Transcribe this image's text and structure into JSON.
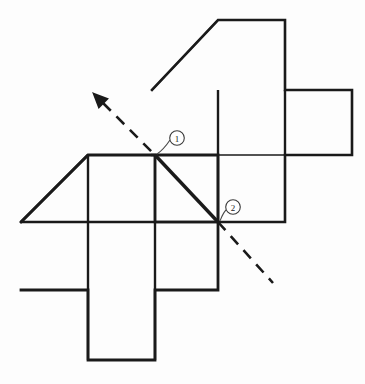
{
  "figure": {
    "type": "geometry-net-diagram",
    "background_color": "#fdfdfd",
    "stroke_color": "#1a1a1a",
    "grid_unit_px": 67,
    "thin_stroke_width": 1.2,
    "thick_stroke_width": 2.6,
    "diagonal_stroke_width": 3.2,
    "dash_pattern": "11 8"
  },
  "labels": [
    {
      "id": "callout-1",
      "text": "1",
      "circle_center": {
        "x": 177,
        "y": 138
      },
      "circle_radius": 7.5,
      "leader_from": {
        "x": 157,
        "y": 153
      },
      "leader_to": {
        "x": 170,
        "y": 139
      }
    },
    {
      "id": "callout-2",
      "text": "2",
      "circle_center": {
        "x": 233,
        "y": 207
      },
      "circle_radius": 7.5,
      "leader_from": {
        "x": 220,
        "y": 220
      },
      "leader_to": {
        "x": 226,
        "y": 209
      }
    }
  ],
  "marked_points": [
    {
      "name": "point-1",
      "x": 155,
      "y": 155
    },
    {
      "name": "point-2",
      "x": 218,
      "y": 222
    }
  ],
  "axis_line": {
    "name": "dashed-axis-of-rotation",
    "start": {
      "x": 96,
      "y": 96
    },
    "end": {
      "x": 273,
      "y": 283
    },
    "arrowhead_at": "start",
    "solid_segment_start": {
      "x": 155,
      "y": 155
    },
    "solid_segment_end": {
      "x": 218,
      "y": 222
    }
  },
  "upper_net": {
    "name": "upper-cube-net",
    "grid_x": [
      152,
      218,
      285,
      352
    ],
    "grid_y": [
      20,
      90,
      155,
      222
    ],
    "outline_points": "152,90 218,20 285,20 285,90 352,90 352,155 285,155 285,222 155,222 155,155 152,155",
    "interior_lines": [
      {
        "x1": 218,
        "y1": 90,
        "x2": 218,
        "y2": 222
      },
      {
        "x1": 285,
        "y1": 90,
        "x2": 285,
        "y2": 155
      },
      {
        "x1": 152,
        "y1": 155,
        "x2": 352,
        "y2": 155
      }
    ],
    "diagonal": {
      "x1": 152,
      "y1": 90,
      "x2": 218,
      "y2": 20
    }
  },
  "lower_net": {
    "name": "lower-cube-net",
    "grid_x": [
      21,
      88,
      155,
      218
    ],
    "grid_y": [
      155,
      222,
      290,
      360
    ],
    "outline_points": "21,222 88,155 218,155 218,290 155,290 155,360 88,360 88,290 21,290",
    "interior_lines": [
      {
        "x1": 88,
        "y1": 155,
        "x2": 88,
        "y2": 360
      },
      {
        "x1": 155,
        "y1": 155,
        "x2": 155,
        "y2": 360
      },
      {
        "x1": 21,
        "y1": 222,
        "x2": 218,
        "y2": 222
      }
    ],
    "diagonal": {
      "x1": 21,
      "y1": 222,
      "x2": 88,
      "y2": 155
    }
  }
}
